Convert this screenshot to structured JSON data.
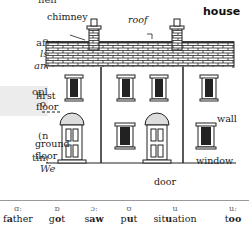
{
  "left_column": {
    "lines": [
      {
        "text": "hen",
        "italic": false
      },
      {
        "text": "after",
        "italic": false
      },
      {
        "text": "ls in",
        "italic": true
      },
      {
        "text": "am-",
        "italic": true
      },
      {
        "text": "ople",
        "italic": false
      },
      {
        "text": "o is",
        "italic": false
      },
      {
        "text": "(no",
        "italic": false
      },
      {
        "text": "ting",
        "italic": false
      },
      {
        "text": "We",
        "italic": true
      }
    ]
  },
  "illustration": {
    "title": "house",
    "labels": {
      "chimney": "chimney",
      "roof": "roof",
      "first_floor_1": "first",
      "first_floor_2": "floor",
      "ground_floor_1": "ground",
      "ground_floor_2": "floor",
      "wall": "wall",
      "window": "window",
      "door": "door"
    }
  },
  "phonetics": [
    {
      "symbol": "ɑː",
      "pre": "f",
      "bold": "a",
      "post": "ther"
    },
    {
      "symbol": "ɒ",
      "pre": "g",
      "bold": "o",
      "post": "t"
    },
    {
      "symbol": "ɔː",
      "pre": "s",
      "bold": "aw",
      "post": ""
    },
    {
      "symbol": "ʊ",
      "pre": "p",
      "bold": "u",
      "post": "t"
    },
    {
      "symbol": "u",
      "pre": "sit",
      "bold": "u",
      "post": "ation"
    },
    {
      "symbol": "uː",
      "pre": "t",
      "bold": "oo",
      "post": ""
    }
  ]
}
